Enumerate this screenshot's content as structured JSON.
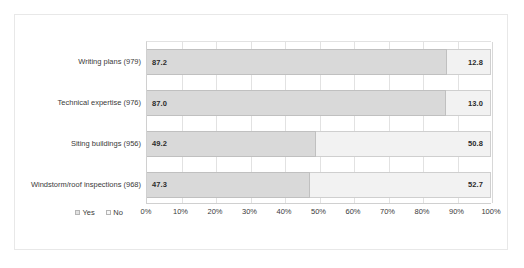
{
  "chart_data": {
    "type": "bar",
    "subtype": "stacked-horizontal-100-percent",
    "title": "",
    "xlabel": "",
    "ylabel": "",
    "xlim": [
      0,
      100
    ],
    "grid": true,
    "legend_position": "bottom-left",
    "categories": [
      "Writing plans (979)",
      "Technical expertise (976)",
      "Siting buildings (956)",
      "Windstorm/roof inspections (968)"
    ],
    "series": [
      {
        "name": "Yes",
        "color": "#d9d9d9",
        "values": [
          87.2,
          87.0,
          49.2,
          47.3
        ],
        "labels": [
          "87.2",
          "87.0",
          "49.2",
          "47.3"
        ]
      },
      {
        "name": "No",
        "color": "#f2f2f2",
        "values": [
          12.8,
          13.0,
          50.8,
          52.7
        ],
        "labels": [
          "12.8",
          "13.0",
          "50.8",
          "52.7"
        ]
      }
    ],
    "xticks": [
      0,
      10,
      20,
      30,
      40,
      50,
      60,
      70,
      80,
      90,
      100
    ],
    "xtick_labels": [
      "0%",
      "10%",
      "20%",
      "30%",
      "40%",
      "50%",
      "60%",
      "70%",
      "80%",
      "90%",
      "100%"
    ]
  },
  "legend": {
    "items": [
      {
        "label": "Yes"
      },
      {
        "label": "No"
      }
    ]
  },
  "colors": {
    "yes": "#d9d9d9",
    "no": "#f2f2f2",
    "grid": "#e2e2e2",
    "axis": "#d0d0d0",
    "frame": "#e8e8e8",
    "text": "#3a3a3a"
  }
}
